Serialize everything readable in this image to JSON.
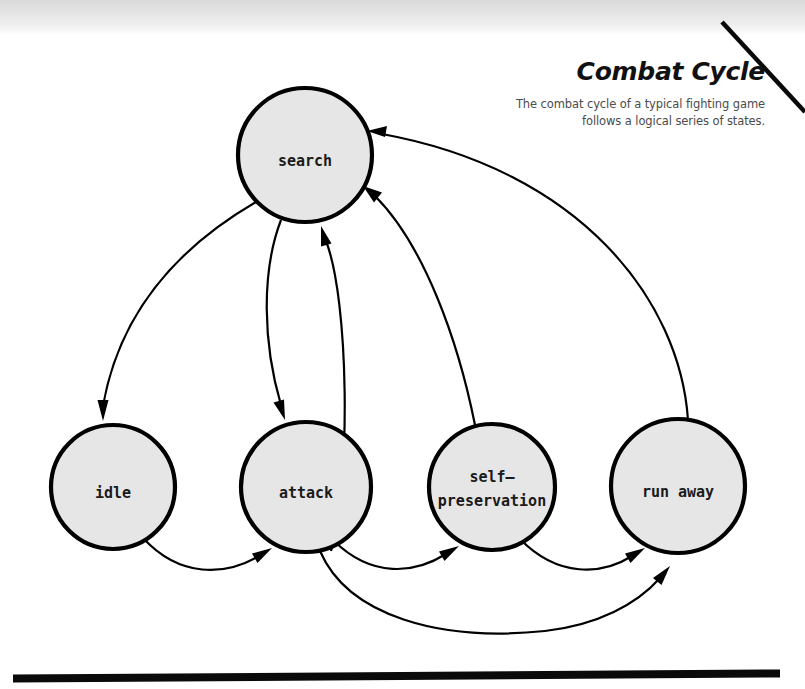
{
  "header": {
    "title": "Combat Cycle",
    "subtitle_line_1": "The combat cycle of a typical fighting game",
    "subtitle_line_2": "follows a logical series of states."
  },
  "colors": {
    "node_fill": "#e6e6e6",
    "node_stroke": "#000000",
    "edge": "#000000",
    "text": "#1a1a1a",
    "subtitle_text": "#4b4b4b",
    "top_band": "#e4e4e4",
    "page_background": "#ffffff"
  },
  "diagram": {
    "type": "state-machine",
    "nodes": [
      {
        "id": "search",
        "label": "search",
        "cx": 305,
        "cy": 155,
        "r": 67
      },
      {
        "id": "idle",
        "label": "idle",
        "cx": 113,
        "cy": 487,
        "r": 62
      },
      {
        "id": "attack",
        "label": "attack",
        "cx": 306,
        "cy": 487,
        "r": 65
      },
      {
        "id": "self-preservation",
        "label_line_1": "self–",
        "label_line_2": "preservation",
        "label": "self-preservation",
        "cx": 492,
        "cy": 487,
        "r": 63
      },
      {
        "id": "run-away",
        "label": "run away",
        "cx": 678,
        "cy": 486,
        "r": 67
      }
    ],
    "edges": [
      {
        "id": "search-to-idle",
        "from": "search",
        "to": "idle",
        "direction": "down-left"
      },
      {
        "id": "search-to-attack",
        "from": "search",
        "to": "attack",
        "direction": "down"
      },
      {
        "id": "attack-to-search",
        "from": "attack",
        "to": "search",
        "direction": "up"
      },
      {
        "id": "self-preservation-to-search",
        "from": "self-preservation",
        "to": "search",
        "direction": "up-left"
      },
      {
        "id": "run-away-to-search",
        "from": "run-away",
        "to": "search",
        "direction": "up-left"
      },
      {
        "id": "idle-to-attack",
        "from": "idle",
        "to": "attack",
        "direction": "right"
      },
      {
        "id": "attack-to-self-preservation",
        "from": "attack",
        "to": "self-preservation",
        "direction": "right"
      },
      {
        "id": "self-preservation-to-run-away",
        "from": "self-preservation",
        "to": "run-away",
        "direction": "right"
      },
      {
        "id": "attack-to-run-away",
        "from": "attack",
        "to": "run-away",
        "direction": "right"
      }
    ]
  },
  "decorations": {
    "corner_rule_label": "diagonal corner rule",
    "bottom_rule_label": "bottom horizontal rule"
  }
}
